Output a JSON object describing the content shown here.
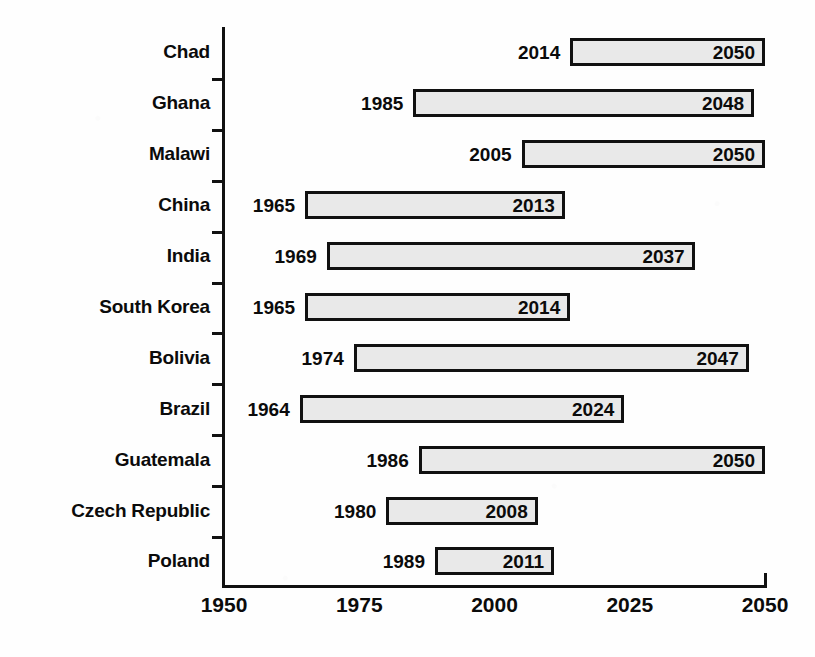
{
  "chart_data": {
    "type": "bar",
    "subtype": "horizontal-range-bar",
    "title": "",
    "xlabel": "",
    "ylabel": "",
    "xlim": [
      1950,
      2050
    ],
    "xticks": [
      "1950",
      "1975",
      "2000",
      "2025",
      "2050"
    ],
    "grid": false,
    "legend": null,
    "bar_fill_color": "#e9e9e9",
    "bar_border_color": "#111111",
    "text_color": "#0b0b0b",
    "background_color": "#ffffff",
    "categories": [
      "Chad",
      "Ghana",
      "Malawi",
      "China",
      "India",
      "South Korea",
      "Bolivia",
      "Brazil",
      "Guatemala",
      "Czech Republic",
      "Poland"
    ],
    "bars": [
      {
        "category": "Chad",
        "start": 2014,
        "end": 2050,
        "start_label": "2014",
        "end_label": "2050"
      },
      {
        "category": "Ghana",
        "start": 1985,
        "end": 2048,
        "start_label": "1985",
        "end_label": "2048"
      },
      {
        "category": "Malawi",
        "start": 2005,
        "end": 2050,
        "start_label": "2005",
        "end_label": "2050"
      },
      {
        "category": "China",
        "start": 1965,
        "end": 2013,
        "start_label": "1965",
        "end_label": "2013"
      },
      {
        "category": "India",
        "start": 1969,
        "end": 2037,
        "start_label": "1969",
        "end_label": "2037"
      },
      {
        "category": "South Korea",
        "start": 1965,
        "end": 2014,
        "start_label": "1965",
        "end_label": "2014"
      },
      {
        "category": "Bolivia",
        "start": 1974,
        "end": 2047,
        "start_label": "1974",
        "end_label": "2047"
      },
      {
        "category": "Brazil",
        "start": 1964,
        "end": 2024,
        "start_label": "1964",
        "end_label": "2024"
      },
      {
        "category": "Guatemala",
        "start": 1986,
        "end": 2050,
        "start_label": "1986",
        "end_label": "2050"
      },
      {
        "category": "Czech Republic",
        "start": 1980,
        "end": 2008,
        "start_label": "1980",
        "end_label": "2008"
      },
      {
        "category": "Poland",
        "start": 1989,
        "end": 2011,
        "start_label": "1989",
        "end_label": "2011"
      }
    ]
  }
}
